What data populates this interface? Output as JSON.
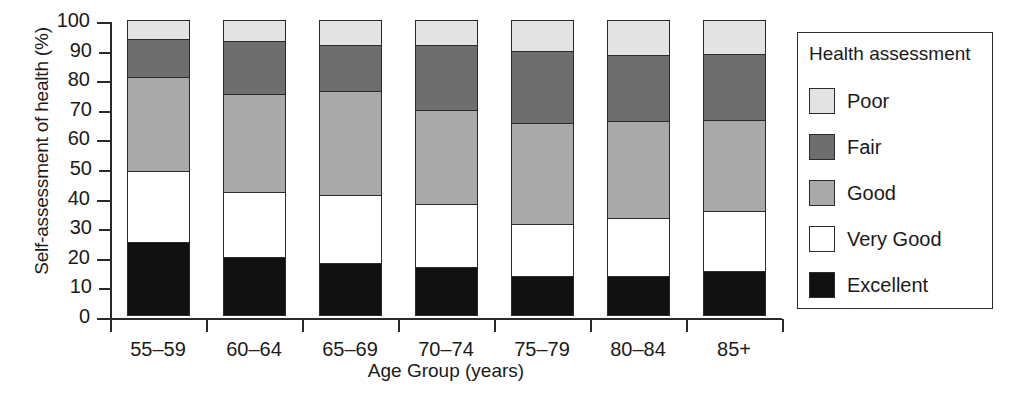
{
  "chart_data": {
    "type": "bar",
    "subtype": "stacked-bar-100-percent",
    "title": "",
    "xlabel": "Age Group (years)",
    "ylabel": "Self-assessment of health (%)",
    "ylim": [
      0,
      100
    ],
    "ytick_labels": [
      "0",
      "10",
      "20",
      "30",
      "40",
      "50",
      "60",
      "70",
      "80",
      "90",
      "100"
    ],
    "ytick_values": [
      0,
      10,
      20,
      30,
      40,
      50,
      60,
      70,
      80,
      90,
      100
    ],
    "grid": false,
    "legend_position": "right-outside",
    "legend_title": "Health assessment",
    "categories": [
      "55–59",
      "60–64",
      "65–69",
      "70–74",
      "75–79",
      "80–84",
      "85+"
    ],
    "series": [
      {
        "name": "Excellent",
        "color": "#111111",
        "values": [
          24.5,
          19.5,
          17.5,
          16.0,
          13.0,
          13.0,
          14.5
        ]
      },
      {
        "name": "Very Good",
        "color": "#ffffff",
        "values": [
          24.0,
          22.0,
          23.0,
          21.5,
          17.5,
          19.5,
          20.5
        ]
      },
      {
        "name": "Good",
        "color": "#a9a9a9",
        "values": [
          32.0,
          33.5,
          35.5,
          32.0,
          34.5,
          33.0,
          31.0
        ]
      },
      {
        "name": "Fair",
        "color": "#6e6e6e",
        "values": [
          13.0,
          18.0,
          15.5,
          22.0,
          24.5,
          22.5,
          22.5
        ]
      },
      {
        "name": "Poor",
        "color": "#e3e3e3",
        "values": [
          6.5,
          7.0,
          8.5,
          8.5,
          10.5,
          12.0,
          11.5
        ]
      }
    ],
    "cumulative_tops": {
      "55–59": [
        24.5,
        48.5,
        80.5,
        93.5,
        100
      ],
      "60–64": [
        19.5,
        41.5,
        75.0,
        93.0,
        100
      ],
      "65–69": [
        17.5,
        40.5,
        76.0,
        91.5,
        100
      ],
      "70–74": [
        16.0,
        37.5,
        69.5,
        91.5,
        100
      ],
      "75–79": [
        13.0,
        30.5,
        65.0,
        89.5,
        100
      ],
      "80–84": [
        13.0,
        32.5,
        65.5,
        88.0,
        100
      ],
      "85+": [
        14.5,
        35.0,
        66.0,
        88.5,
        100
      ]
    }
  },
  "legend": {
    "title": "Health assessment",
    "items": [
      {
        "label": "Poor",
        "color": "#e3e3e3"
      },
      {
        "label": "Fair",
        "color": "#6e6e6e"
      },
      {
        "label": "Good",
        "color": "#a9a9a9"
      },
      {
        "label": "Very Good",
        "color": "#ffffff"
      },
      {
        "label": "Excellent",
        "color": "#111111"
      }
    ]
  },
  "axes": {
    "y_title": "Self-assessment of health (%)",
    "x_title": "Age Group (years)"
  }
}
